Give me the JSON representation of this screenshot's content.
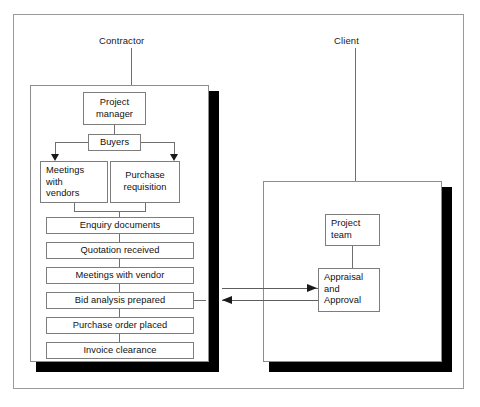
{
  "diagram": {
    "title_contractor": "Contractor",
    "title_client": "Client",
    "contractor": {
      "project_manager": "Project\nmanager",
      "project_manager_line1": "Project",
      "project_manager_line2": "manager",
      "buyers": "Buyers",
      "meetings_with_vendors_line1": "Meetings",
      "meetings_with_vendors_line2": "with",
      "meetings_with_vendors_line3": "vendors",
      "purchase_requisition_line1": "Purchase",
      "purchase_requisition_line2": "requisition",
      "steps": [
        "Enquiry documents",
        "Quotation received",
        "Meetings with vendor",
        "Bid analysis prepared",
        "Purchase order placed",
        "Invoice clearance"
      ]
    },
    "client": {
      "project_team_line1": "Project",
      "project_team_line2": "team",
      "appraisal_line1": "Appraisal",
      "appraisal_line2": "and",
      "appraisal_line3": "Approval"
    },
    "colors": {
      "frame": "#9a9a9a",
      "panel_border": "#8d8d8d",
      "node_border": "#7d7d7d",
      "connector": "#6f6f6f",
      "shadow": "#000000",
      "text": "#111111",
      "background": "#ffffff"
    }
  }
}
